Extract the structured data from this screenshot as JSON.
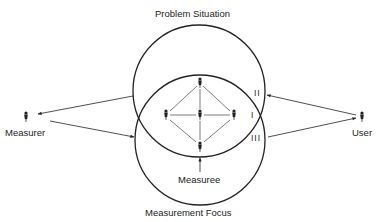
{
  "diagram": {
    "labels": {
      "top": "Problem Situation",
      "bottom": "Measurement Focus",
      "left": "Measurer",
      "right": "User",
      "center_bottom": "Measuree"
    },
    "regions": {
      "upper": "II",
      "intersection": "I",
      "lower": "III"
    },
    "circles": [
      {
        "name": "Problem Situation",
        "cx": 199,
        "cy": 91,
        "r": 66
      },
      {
        "name": "Measurement Focus",
        "cx": 200,
        "cy": 140,
        "r": 65
      }
    ],
    "nodes": [
      {
        "name": "measurer",
        "x": 26,
        "y": 117
      },
      {
        "name": "user",
        "x": 362,
        "y": 117
      },
      {
        "name": "team-top",
        "x": 200,
        "y": 82
      },
      {
        "name": "team-left",
        "x": 166,
        "y": 115
      },
      {
        "name": "team-center",
        "x": 200,
        "y": 115
      },
      {
        "name": "team-right",
        "x": 234,
        "y": 115
      },
      {
        "name": "team-bottom",
        "x": 200,
        "y": 146
      }
    ],
    "line_color": "#222222"
  }
}
